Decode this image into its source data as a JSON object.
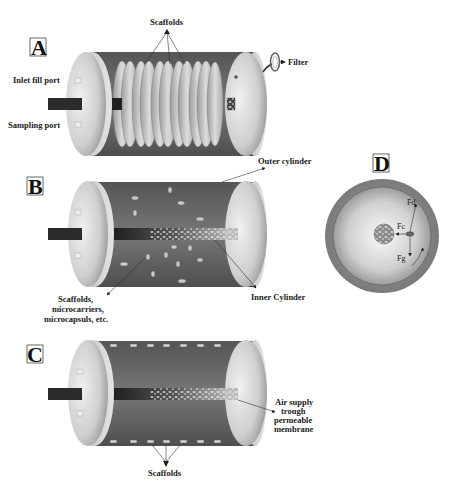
{
  "figure": {
    "panels": {
      "A": {
        "letter": "A",
        "labels": {
          "scaffolds": "Scaffolds",
          "filter": "Filter",
          "inlet": "Inlet fill port",
          "sampling": "Sampling port"
        }
      },
      "B": {
        "letter": "B",
        "labels": {
          "outer": "Outer cylinder",
          "inner": "Inner Cylinder",
          "carriers_1": "Scaffolds,",
          "carriers_2": "microcarriers,",
          "carriers_3": "microcapsuls, etc."
        }
      },
      "C": {
        "letter": "C",
        "labels": {
          "air_1": "Air supply",
          "air_2": "trough",
          "air_3": "permeable",
          "air_4": "membrane",
          "scaffolds": "Scaffolds"
        }
      },
      "D": {
        "letter": "D",
        "forces": {
          "fd": "Fd",
          "fc": "Fc",
          "fg": "Fg"
        }
      }
    },
    "colors": {
      "cylinder_body": "#6e6e6e",
      "end_cap": "#d0d0d0",
      "background": "#ffffff",
      "core": "#2a2a2a"
    }
  }
}
